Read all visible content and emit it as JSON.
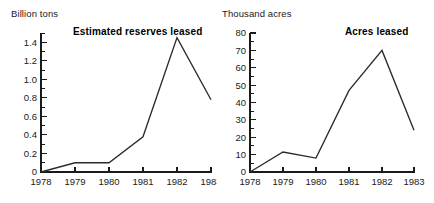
{
  "figure": {
    "background_color": "#ffffff",
    "line_color": "#2b2b2b",
    "text_color": "#1a1a1a"
  },
  "panels": {
    "left": {
      "unit_label": "Billion tons",
      "title": "Estimated reserves leased"
    },
    "right": {
      "unit_label": "Thousand acres",
      "title": "Acres leased"
    }
  },
  "chart_data": [
    {
      "type": "line",
      "title": "Estimated reserves leased",
      "xlabel": "",
      "ylabel": "Billion tons",
      "categories": [
        "1978",
        "1979",
        "1980",
        "1981",
        "1982",
        "1983"
      ],
      "x": [
        1978,
        1979,
        1980,
        1981,
        1982,
        1983
      ],
      "values": [
        0,
        0.1,
        0.1,
        0.38,
        1.45,
        0.78
      ],
      "ylim": [
        0,
        1.5
      ],
      "xlim": [
        1978,
        1983
      ],
      "ytick_labels": [
        "0",
        "0.2",
        "0.4",
        "0.6",
        "0.8",
        "1.0",
        "1.2",
        "1.4"
      ],
      "ytick_values": [
        0,
        0.2,
        0.4,
        0.6,
        0.8,
        1.0,
        1.2,
        1.4
      ],
      "yminor_step": 0.1,
      "xtick_labels": [
        "1978",
        "1979",
        "1980",
        "1981",
        "1982",
        "1983"
      ],
      "grid": false,
      "legend": "none"
    },
    {
      "type": "line",
      "title": "Acres leased",
      "xlabel": "",
      "ylabel": "Thousand acres",
      "categories": [
        "1978",
        "1979",
        "1980",
        "1981",
        "1982",
        "1983"
      ],
      "x": [
        1978,
        1979,
        1980,
        1981,
        1982,
        1983
      ],
      "values": [
        0,
        11.5,
        8,
        47,
        70,
        24
      ],
      "ylim": [
        0,
        80
      ],
      "xlim": [
        1978,
        1983
      ],
      "ytick_labels": [
        "0",
        "10",
        "20",
        "30",
        "40",
        "50",
        "60",
        "70",
        "80"
      ],
      "ytick_values": [
        0,
        10,
        20,
        30,
        40,
        50,
        60,
        70,
        80
      ],
      "yminor_step": 5,
      "xtick_labels": [
        "1978",
        "1979",
        "1980",
        "1981",
        "1982",
        "1983"
      ],
      "grid": false,
      "legend": "none"
    }
  ]
}
